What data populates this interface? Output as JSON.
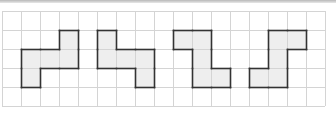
{
  "grid": {
    "cols": 17,
    "rows": 5,
    "cell": 19,
    "origin_x": 2,
    "origin_y": 11,
    "line_color": "#d4d4d4",
    "fill_color": "#eeeeee",
    "outline_color": "#333333"
  },
  "shapes": [
    {
      "name": "shape-1",
      "cells": [
        [
          3,
          1
        ],
        [
          1,
          2
        ],
        [
          2,
          2
        ],
        [
          3,
          2
        ],
        [
          1,
          3
        ]
      ]
    },
    {
      "name": "shape-2",
      "cells": [
        [
          5,
          1
        ],
        [
          5,
          2
        ],
        [
          6,
          2
        ],
        [
          7,
          2
        ],
        [
          7,
          3
        ]
      ]
    },
    {
      "name": "shape-3",
      "cells": [
        [
          9,
          1
        ],
        [
          10,
          1
        ],
        [
          10,
          2
        ],
        [
          10,
          3
        ],
        [
          11,
          3
        ]
      ]
    },
    {
      "name": "shape-4",
      "cells": [
        [
          14,
          1
        ],
        [
          15,
          1
        ],
        [
          14,
          2
        ],
        [
          13,
          3
        ],
        [
          14,
          3
        ]
      ]
    }
  ]
}
